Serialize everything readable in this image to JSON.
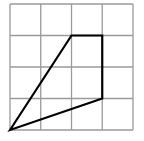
{
  "diagram": {
    "type": "grid-polygon",
    "grid": {
      "columns": 4,
      "rows": 4,
      "origin_px": [
        10,
        130
      ],
      "cell_w_px": 30.75,
      "cell_h_px": 31.5,
      "line_color": "#9a9a9a",
      "line_width": 1.3
    },
    "polygon": {
      "vertices": [
        [
          0,
          0
        ],
        [
          2,
          3
        ],
        [
          3,
          3
        ],
        [
          3,
          1
        ]
      ],
      "stroke": "#000000",
      "stroke_width": 2.2
    }
  }
}
